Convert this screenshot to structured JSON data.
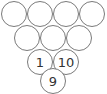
{
  "diagram": {
    "type": "number-triangle",
    "line_color": "#7a7a7a",
    "rows": [
      {
        "cells": [
          {
            "label": "",
            "x": 1,
            "y": 1
          },
          {
            "label": "",
            "x": 27,
            "y": 1
          },
          {
            "label": "",
            "x": 53,
            "y": 1
          },
          {
            "label": "",
            "x": 79,
            "y": 1
          }
        ]
      },
      {
        "cells": [
          {
            "label": "",
            "x": 14,
            "y": 25
          },
          {
            "label": "",
            "x": 40,
            "y": 25
          },
          {
            "label": "",
            "x": 66,
            "y": 25
          }
        ]
      },
      {
        "cells": [
          {
            "label": "1",
            "x": 27,
            "y": 49
          },
          {
            "label": "10",
            "x": 53,
            "y": 49
          }
        ]
      },
      {
        "cells": [
          {
            "label": "9",
            "x": 40,
            "y": 68
          }
        ]
      }
    ]
  }
}
